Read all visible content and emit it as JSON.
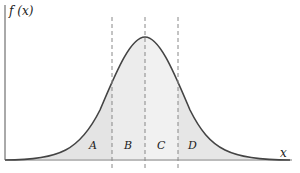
{
  "diagram": {
    "y_axis_label": "f (x)",
    "x_axis_label": "x",
    "regions": [
      {
        "label": "A",
        "x": 92
      },
      {
        "label": "B",
        "x": 127
      },
      {
        "label": "C",
        "x": 160
      },
      {
        "label": "D",
        "x": 192
      }
    ],
    "dashed_lines_x": [
      112,
      145,
      178
    ],
    "colors": {
      "curve": "#444444",
      "fill_outer": "#e6e6e6",
      "fill_inner": "#eeeeee",
      "dashed": "#888888",
      "axis": "#555555"
    }
  }
}
